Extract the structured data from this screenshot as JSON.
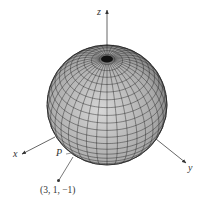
{
  "figure": {
    "axes": {
      "x": {
        "label": "x"
      },
      "y": {
        "label": "y"
      },
      "z": {
        "label": "z"
      }
    },
    "point_P": {
      "label": "P"
    },
    "external_point": {
      "label": "(3, 1, −1)"
    },
    "sphere": {
      "meridians": 36,
      "parallels": 24,
      "fill": "#b8b8b8",
      "line": "#2a2a2a"
    }
  }
}
